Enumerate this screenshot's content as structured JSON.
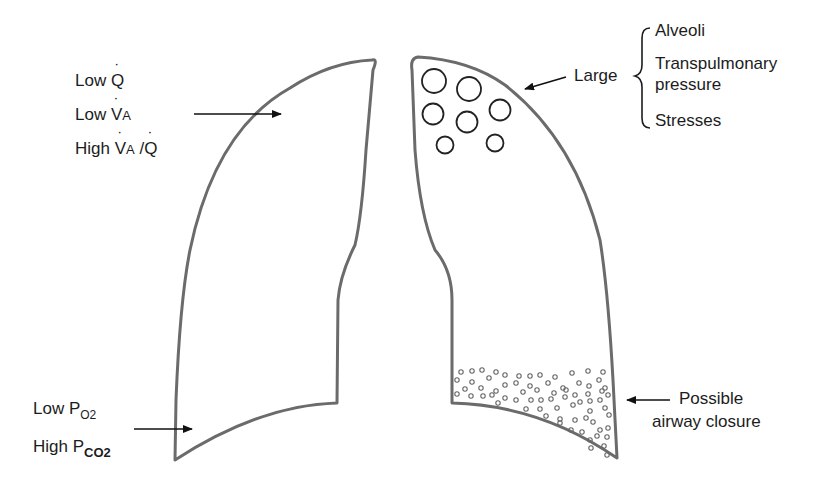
{
  "diagram": {
    "colors": {
      "outline": "#6b6b6b",
      "text": "#1c1c1c",
      "arrow": "#111111",
      "background": "#ffffff"
    },
    "left_lung": {
      "apex_labels": {
        "line1": {
          "prefix": "Low ",
          "symbol": "Q",
          "dot": true
        },
        "line2": {
          "prefix": "Low ",
          "symbol": "V",
          "dot": true,
          "subscript": "A"
        },
        "line3": {
          "prefix": "High ",
          "symbol": "V",
          "dot": true,
          "subscript": "A",
          "separator": " /",
          "symbol2": "Q",
          "dot2": true
        }
      },
      "base_labels": {
        "line1": {
          "prefix": "Low P",
          "subscript": "O2"
        },
        "line2": {
          "prefix": "High P",
          "subscript": "CO2"
        }
      }
    },
    "right_lung": {
      "apex_label": "Large",
      "apex_brace_items": [
        "Alveoli",
        "Transpulmonary",
        "pressure",
        "Stresses"
      ],
      "apex_alveoli_count": 8,
      "base_label_line1": "Possible",
      "base_label_line2": "airway closure"
    }
  }
}
